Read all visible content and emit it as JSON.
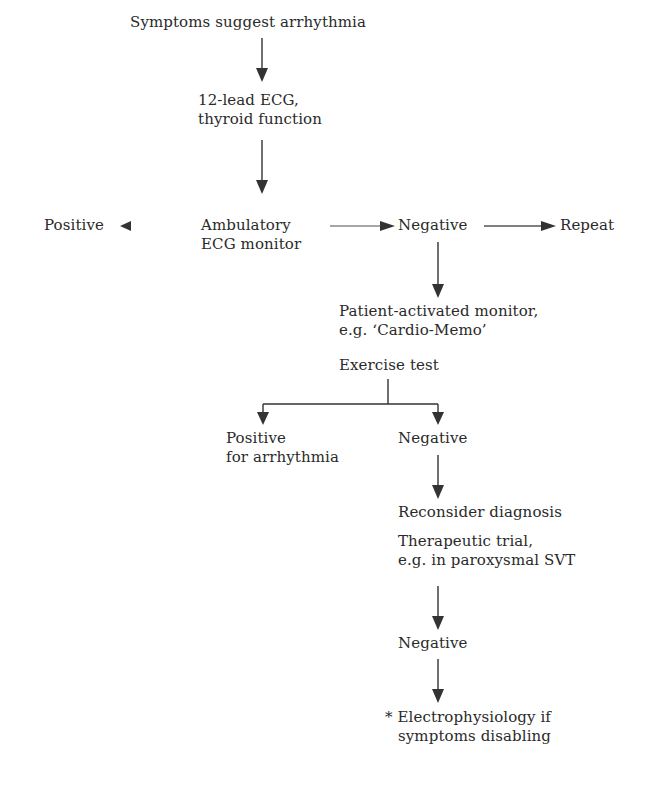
{
  "diagram": {
    "type": "flowchart",
    "nodes": {
      "start": {
        "lines": [
          "Symptoms suggest arrhythmia"
        ]
      },
      "ecg12": {
        "lines": [
          "12-lead ECG,",
          "thyroid function"
        ]
      },
      "ambulatory": {
        "lines": [
          "Ambulatory",
          "ECG monitor"
        ]
      },
      "positive_left": {
        "lines": [
          "Positive"
        ]
      },
      "negative_mid": {
        "lines": [
          "Negative"
        ]
      },
      "repeat": {
        "lines": [
          "Repeat"
        ]
      },
      "patient_monitor": {
        "lines": [
          "Patient-activated monitor,",
          "e.g. ‘Cardio-Memo’"
        ]
      },
      "exercise_test": {
        "lines": [
          "Exercise test"
        ]
      },
      "positive_arrhythmia": {
        "lines": [
          "Positive",
          "for arrhythmia"
        ]
      },
      "negative_exercise": {
        "lines": [
          "Negative"
        ]
      },
      "reconsider": {
        "lines": [
          "Reconsider diagnosis"
        ]
      },
      "therapeutic_trial": {
        "lines": [
          "Therapeutic trial,",
          "e.g. in paroxysmal SVT"
        ]
      },
      "negative_trial": {
        "lines": [
          "Negative"
        ]
      },
      "electrophysiology": {
        "lines": [
          "* Electrophysiology if",
          "symptoms disabling"
        ]
      }
    },
    "edges": [
      {
        "from": "start",
        "to": "ecg12"
      },
      {
        "from": "ecg12",
        "to": "ambulatory"
      },
      {
        "from": "ambulatory",
        "to": "positive_left"
      },
      {
        "from": "ambulatory",
        "to": "negative_mid"
      },
      {
        "from": "negative_mid",
        "to": "repeat"
      },
      {
        "from": "negative_mid",
        "to": "patient_monitor"
      },
      {
        "from": "exercise_test",
        "to": "positive_arrhythmia"
      },
      {
        "from": "exercise_test",
        "to": "negative_exercise"
      },
      {
        "from": "negative_exercise",
        "to": "reconsider"
      },
      {
        "from": "therapeutic_trial",
        "to": "negative_trial"
      },
      {
        "from": "negative_trial",
        "to": "electrophysiology"
      }
    ],
    "colors": {
      "text": "#2a2a2a",
      "line": "#333333",
      "background": "#ffffff"
    }
  }
}
